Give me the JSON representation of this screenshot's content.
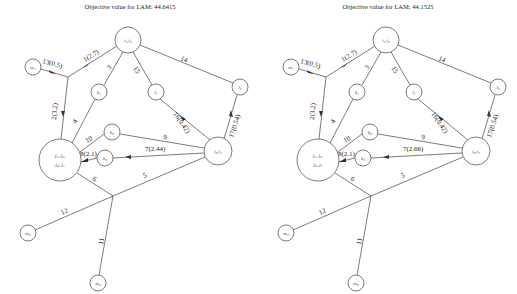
{
  "panels": [
    {
      "title": "Objective value for LAM: 44.6415",
      "nodes": {
        "i12": "i₁,i₂",
        "m1": "m₁",
        "k1": "k₁",
        "l1": "l₁",
        "l2": "l₂",
        "j_line1": "j₁, j₂,",
        "j_line2": "j₃, j₄",
        "k3": "k₃",
        "k2": "k₂",
        "i34": "i₃,i₄",
        "m2": "m₂",
        "m3": "m₃"
      },
      "edges": {
        "e1": "1(2.7)",
        "e13": "13(0.5)",
        "e14": "14",
        "e3": "3",
        "e15": "15",
        "e2": "2(3.2)",
        "e4": "4",
        "e16": "16(0.42)",
        "e17": "17(0.54)",
        "e10": "10",
        "e9": "9",
        "e8": "8(2.1)",
        "e7": "7(2.44)",
        "e6": "6",
        "e5": "5",
        "e12": "12",
        "e11": "11"
      }
    },
    {
      "title": "Objective value for LAM: 44.1525",
      "nodes": {
        "i12": "i₁,i₂",
        "m1": "m₁",
        "k1": "k₁",
        "l1": "l₁",
        "l2": "l₂",
        "j_line1": "j₁, j₂,",
        "j_line2": "j₃, j₄",
        "k3": "k₃",
        "k2": "k₂",
        "i34": "i₃,i₄",
        "m2": "m₂",
        "m3": "m₃"
      },
      "edges": {
        "e1": "1(2.7)",
        "e13": "13(0.5)",
        "e14": "14",
        "e3": "3",
        "e15": "15",
        "e2": "2(3.2)",
        "e4": "4",
        "e16": "16(0.42)",
        "e17": "17(0.54)",
        "e10": "10",
        "e9": "9",
        "e8": "8(2.1)",
        "e7": "7(2.66)",
        "e6": "6",
        "e5": "5",
        "e12": "12",
        "e11": "11"
      }
    }
  ]
}
